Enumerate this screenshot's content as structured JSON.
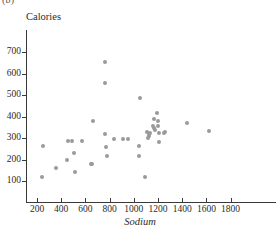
{
  "figure": {
    "label": "(b)",
    "label_visible_fragment": "(b)"
  },
  "chart_data": {
    "type": "scatter",
    "title": "",
    "xlabel": "Sodium",
    "ylabel": "Calories",
    "xlim": [
      100,
      1900
    ],
    "ylim": [
      60,
      760
    ],
    "xticks": [
      200,
      400,
      600,
      800,
      1000,
      1200,
      1400,
      1600,
      1800
    ],
    "yticks": [
      100,
      200,
      300,
      400,
      500,
      600,
      700
    ],
    "grid": false,
    "legend": null,
    "marker": {
      "shape": "circle",
      "color": "#9a9a9a",
      "size": 4
    },
    "n_points": 42,
    "points": [
      {
        "x": 245,
        "y": 120
      },
      {
        "x": 250,
        "y": 262
      },
      {
        "x": 355,
        "y": 160
      },
      {
        "x": 450,
        "y": 198
      },
      {
        "x": 455,
        "y": 287
      },
      {
        "x": 490,
        "y": 287
      },
      {
        "x": 505,
        "y": 232
      },
      {
        "x": 515,
        "y": 140
      },
      {
        "x": 570,
        "y": 287
      },
      {
        "x": 645,
        "y": 178
      },
      {
        "x": 655,
        "y": 178
      },
      {
        "x": 660,
        "y": 377
      },
      {
        "x": 760,
        "y": 655
      },
      {
        "x": 760,
        "y": 557
      },
      {
        "x": 765,
        "y": 317
      },
      {
        "x": 768,
        "y": 258
      },
      {
        "x": 780,
        "y": 218
      },
      {
        "x": 840,
        "y": 295
      },
      {
        "x": 910,
        "y": 297
      },
      {
        "x": 950,
        "y": 297
      },
      {
        "x": 1040,
        "y": 265
      },
      {
        "x": 1045,
        "y": 217
      },
      {
        "x": 1050,
        "y": 485
      },
      {
        "x": 1090,
        "y": 120
      },
      {
        "x": 1125,
        "y": 318
      },
      {
        "x": 1128,
        "y": 310
      },
      {
        "x": 1130,
        "y": 325
      },
      {
        "x": 1160,
        "y": 355
      },
      {
        "x": 1165,
        "y": 388
      },
      {
        "x": 1170,
        "y": 345
      },
      {
        "x": 1195,
        "y": 415
      },
      {
        "x": 1200,
        "y": 378
      },
      {
        "x": 1200,
        "y": 358
      },
      {
        "x": 1205,
        "y": 325
      },
      {
        "x": 1210,
        "y": 282
      },
      {
        "x": 1250,
        "y": 325
      },
      {
        "x": 1255,
        "y": 327
      },
      {
        "x": 1440,
        "y": 372
      },
      {
        "x": 1620,
        "y": 332
      },
      {
        "x": 1105,
        "y": 330
      },
      {
        "x": 1120,
        "y": 300
      },
      {
        "x": 1175,
        "y": 335
      }
    ]
  }
}
